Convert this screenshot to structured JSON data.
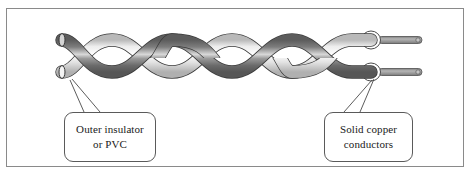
{
  "figure": {
    "caption_remnant": "",
    "border_color": "#8a8a8a",
    "background_color": "#ffffff"
  },
  "diagram": {
    "type": "twisted-pair-cable",
    "wire_dark_color": "#6e6e6e",
    "wire_light_color": "#f2f2f2",
    "wire_outline_color": "#3a3a3a",
    "conductor_color": "#9a9a9a",
    "insulator_ring_color": "#ffffff",
    "leader_line_color": "#4a4a4a",
    "twist_count": 4
  },
  "callouts": [
    {
      "id": "outer-insulator",
      "line1": "Outer insulator",
      "line2": "or PVC"
    },
    {
      "id": "solid-copper-conductors",
      "line1": "Solid copper",
      "line2": "conductors"
    }
  ]
}
